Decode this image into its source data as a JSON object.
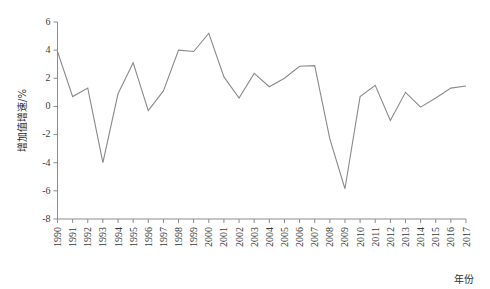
{
  "chart_data": {
    "type": "line",
    "title": "",
    "xlabel": "年份",
    "ylabel": "增加值增速/%",
    "xlim": [
      1990,
      2017
    ],
    "ylim": [
      -8,
      6
    ],
    "yticks": [
      6,
      4,
      2,
      0,
      -2,
      -4,
      -6,
      -8
    ],
    "ytick_labels": [
      "6",
      "4",
      "2",
      "0",
      "-2",
      "-4",
      "-6",
      "-8"
    ],
    "grid": false,
    "legend": null,
    "categories": [
      "1990",
      "1991",
      "1992",
      "1993",
      "1994",
      "1995",
      "1996",
      "1997",
      "1998",
      "1999",
      "2000",
      "2001",
      "2002",
      "2003",
      "2004",
      "2005",
      "2006",
      "2007",
      "2008",
      "2009",
      "2010",
      "2011",
      "2012",
      "2013",
      "2014",
      "2015",
      "2016",
      "2017"
    ],
    "series": [
      {
        "name": "增加值增速",
        "color": "#8a8a8a",
        "values": [
          3.9,
          0.7,
          1.3,
          -4.0,
          0.9,
          3.1,
          -0.3,
          1.1,
          4.0,
          3.9,
          5.2,
          2.1,
          0.6,
          2.35,
          1.4,
          2.0,
          2.85,
          2.9,
          -2.3,
          -5.85,
          0.7,
          1.5,
          -1.0,
          1.0,
          -0.05,
          0.6,
          1.3,
          1.45
        ]
      }
    ]
  },
  "axis": {
    "y_title": "增加值增速/%",
    "x_title": "年份"
  }
}
